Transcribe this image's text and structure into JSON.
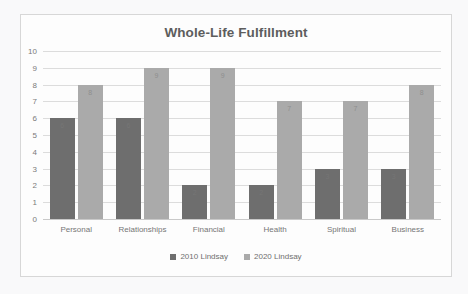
{
  "chart_data": {
    "type": "bar",
    "title": "Whole-Life Fulfillment",
    "xlabel": "",
    "ylabel": "",
    "ylim": [
      0,
      10
    ],
    "yticks": [
      10,
      9,
      8,
      7,
      6,
      5,
      4,
      3,
      2,
      1,
      0
    ],
    "grid": true,
    "legend_position": "bottom",
    "categories": [
      "Personal",
      "Relationships",
      "Financial",
      "Health",
      "Spiritual",
      "Business"
    ],
    "series": [
      {
        "name": "2010 Lindsay",
        "color": "#6e6e6e",
        "values": [
          6,
          6,
          2,
          2,
          3,
          3
        ],
        "labels": [
          "6",
          "6",
          "2",
          "2",
          "3",
          "3"
        ]
      },
      {
        "name": "2020 Lindsay",
        "color": "#aaaaaa",
        "values": [
          8,
          9,
          9,
          7,
          7,
          8
        ],
        "labels": [
          "8",
          "9",
          "9",
          "7",
          "7",
          "8"
        ]
      }
    ]
  },
  "colors": {
    "series_2010": "#6e6e6e",
    "series_2020": "#aaaaaa",
    "gridline": "#dcdcdc",
    "title_text": "#5d5d5d",
    "axis_text": "#767676",
    "frame_border": "#d7d7d7",
    "page_background": "#f9f9fa",
    "plot_background": "#fdfdfd"
  }
}
